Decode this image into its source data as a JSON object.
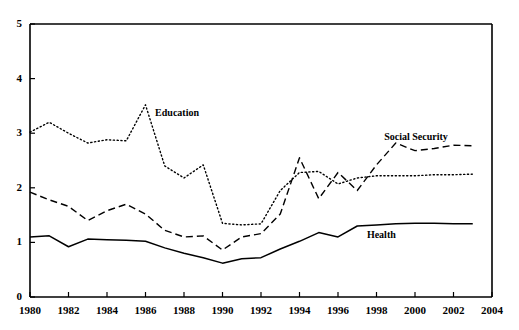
{
  "chart_data": {
    "type": "line",
    "title": "",
    "subtitle": "",
    "xlabel": "",
    "ylabel": "",
    "xlim": [
      1980,
      2004
    ],
    "ylim": [
      0,
      5
    ],
    "grid": false,
    "legend_position": "inline-annotations",
    "x_ticks": [
      "1980",
      "1982",
      "1984",
      "1986",
      "1988",
      "1990",
      "1992",
      "1994",
      "1996",
      "1998",
      "2000",
      "2002",
      "2004"
    ],
    "y_ticks": [
      "0",
      "1",
      "2",
      "3",
      "4",
      "5"
    ],
    "x": [
      1980,
      1981,
      1982,
      1983,
      1984,
      1985,
      1986,
      1987,
      1988,
      1989,
      1990,
      1991,
      1992,
      1993,
      1994,
      1995,
      1996,
      1997,
      1998,
      1999,
      2000,
      2001,
      2002,
      2003
    ],
    "series": [
      {
        "name": "Education",
        "style": "dotted",
        "label": "Education",
        "label_x": 1986.5,
        "label_y": 3.35,
        "values": [
          3.02,
          3.2,
          3.0,
          2.82,
          2.88,
          2.86,
          3.52,
          2.4,
          2.18,
          2.42,
          1.35,
          1.32,
          1.34,
          1.95,
          2.28,
          2.3,
          2.07,
          2.18,
          2.22,
          2.22,
          2.22,
          2.24,
          2.24,
          2.25
        ]
      },
      {
        "name": "Social Security",
        "style": "dashed",
        "label": "Social Security",
        "label_x": 1998.4,
        "label_y": 2.92,
        "values": [
          1.92,
          1.78,
          1.66,
          1.4,
          1.58,
          1.7,
          1.52,
          1.22,
          1.1,
          1.12,
          0.86,
          1.1,
          1.16,
          1.52,
          2.55,
          1.8,
          2.28,
          1.95,
          2.42,
          2.82,
          2.68,
          2.72,
          2.78,
          2.77
        ]
      },
      {
        "name": "Health",
        "style": "solid",
        "label": "Health",
        "label_x": 1997.5,
        "label_y": 1.12,
        "values": [
          1.1,
          1.12,
          0.92,
          1.06,
          1.05,
          1.04,
          1.02,
          0.9,
          0.8,
          0.72,
          0.62,
          0.7,
          0.72,
          0.88,
          1.02,
          1.18,
          1.1,
          1.3,
          1.32,
          1.34,
          1.35,
          1.35,
          1.34,
          1.34
        ]
      }
    ]
  },
  "axes": {
    "y_tick_labels": [
      "5",
      "4",
      "3",
      "2",
      "1",
      "0"
    ],
    "x_tick_labels": [
      "1980",
      "1982",
      "1984",
      "1986",
      "1988",
      "1990",
      "1992",
      "1994",
      "1996",
      "1998",
      "2000",
      "2002",
      "2004"
    ]
  }
}
